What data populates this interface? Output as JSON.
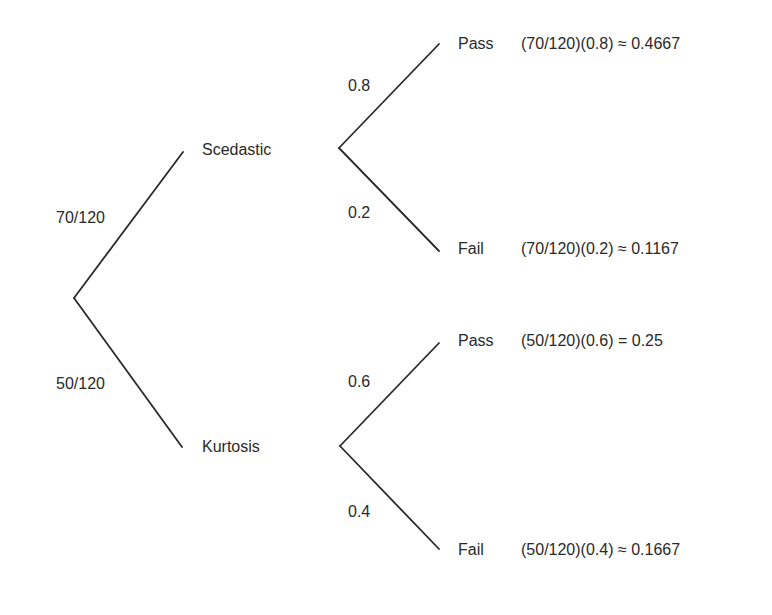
{
  "diagram": {
    "type": "probability-tree",
    "root": {
      "branches": [
        {
          "probability_label": "70/120",
          "node_label": "Scedastic",
          "outcomes": [
            {
              "probability_label": "0.8",
              "node_label": "Pass",
              "result": "(70/120)(0.8) ≈ 0.4667"
            },
            {
              "probability_label": "0.2",
              "node_label": "Fail",
              "result": "(70/120)(0.2) ≈ 0.1167"
            }
          ]
        },
        {
          "probability_label": "50/120",
          "node_label": "Kurtosis",
          "outcomes": [
            {
              "probability_label": "0.6",
              "node_label": "Pass",
              "result": "(50/120)(0.6) = 0.25"
            },
            {
              "probability_label": "0.4",
              "node_label": "Fail",
              "result": "(50/120)(0.4) ≈ 0.1667"
            }
          ]
        }
      ]
    },
    "colors": {
      "line": "#2a2a2a",
      "text": "#2a2a2a",
      "background": "#ffffff"
    }
  }
}
